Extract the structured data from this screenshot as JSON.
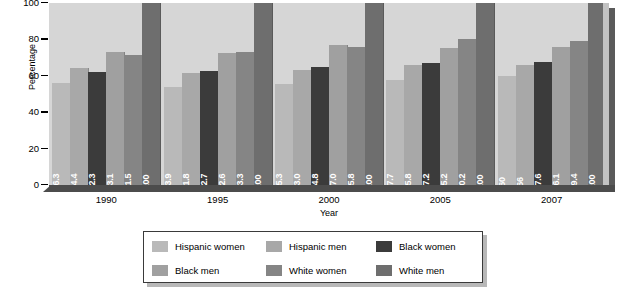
{
  "chart_data": {
    "type": "bar",
    "title": "",
    "xlabel": "Year",
    "ylabel": "Percentage",
    "categories": [
      "1990",
      "1995",
      "2000",
      "2005",
      "2007"
    ],
    "ylim": [
      0,
      100
    ],
    "yticks": [
      "0",
      "20",
      "40",
      "60",
      "80",
      "100"
    ],
    "grid": false,
    "legend_position": "bottom",
    "series": [
      {
        "name": "Hispanic women",
        "color": "#b9b9b9",
        "values": [
          56.3,
          53.9,
          55.3,
          57.7,
          60
        ],
        "labels": [
          "56.3",
          "53.9",
          "55.3",
          "57.7",
          "60"
        ]
      },
      {
        "name": "Hispanic men",
        "color": "#a8a8a8",
        "values": [
          64.4,
          61.8,
          63.0,
          65.8,
          66
        ],
        "labels": [
          "64.4",
          "61.8",
          "63.0",
          "65.8",
          "66"
        ]
      },
      {
        "name": "Black women",
        "color": "#3b3b3b",
        "values": [
          62.3,
          62.7,
          64.8,
          67.2,
          67.6
        ],
        "labels": [
          "62.3",
          "62.7",
          "64.8",
          "67.2",
          "67.6"
        ]
      },
      {
        "name": "Black men",
        "color": "#a0a0a0",
        "values": [
          73.1,
          72.6,
          77.0,
          75.2,
          76.1
        ],
        "labels": [
          "73.1",
          "72.6",
          "77.0",
          "75.2",
          "76.1"
        ]
      },
      {
        "name": "White women",
        "color": "#858585",
        "values": [
          71.5,
          73.3,
          75.8,
          80.2,
          79.4
        ],
        "labels": [
          "71.5",
          "73.3",
          "75.8",
          "80.2",
          "79.4"
        ]
      },
      {
        "name": "White men",
        "color": "#6e6e6e",
        "values": [
          100,
          100,
          100,
          100,
          100
        ],
        "labels": [
          "100",
          "100",
          "100",
          "100",
          "100"
        ]
      }
    ]
  },
  "colors": {
    "plot_background": "#d6d6d6",
    "floor": "#4c4c4c",
    "shadow": "#5a5a5a",
    "page_background": "#ffffff",
    "value_label": "#ffffff"
  }
}
